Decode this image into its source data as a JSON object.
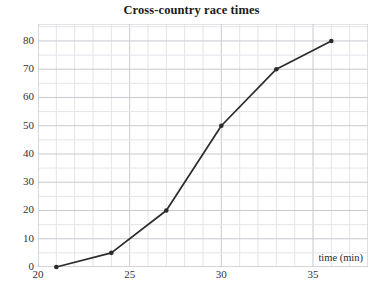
{
  "chart_data": {
    "type": "line",
    "title": "Cross-country race times",
    "xlabel": "time (min)",
    "ylabel": "",
    "x": [
      21,
      24,
      27,
      30,
      33,
      36
    ],
    "values": [
      0,
      5,
      20,
      50,
      70,
      80
    ],
    "series": [
      {
        "name": "race times",
        "x": [
          21,
          24,
          27,
          30,
          33,
          36
        ],
        "values": [
          0,
          5,
          20,
          50,
          70,
          80
        ]
      }
    ],
    "xlim": [
      20,
      38
    ],
    "ylim": [
      0,
      86
    ],
    "xticks": [
      20,
      25,
      30,
      35
    ],
    "xtick_labels": [
      "20",
      "25",
      "30",
      "35"
    ],
    "yticks": [
      0,
      10,
      20,
      30,
      40,
      50,
      60,
      70,
      80
    ],
    "ytick_labels": [
      "0",
      "10",
      "20",
      "30",
      "40",
      "50",
      "60",
      "70",
      "80"
    ],
    "x_minor_step": 1,
    "y_minor_step": 5,
    "grid": true,
    "legend": false,
    "line_color": "#2b2b2b",
    "marker_color": "#2b2b2b",
    "grid_major_color": "#c9c9cf",
    "grid_minor_color": "#e4e4ea",
    "background": "#ffffff"
  }
}
